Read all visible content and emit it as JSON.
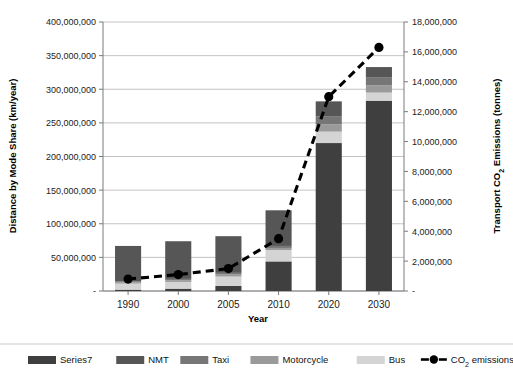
{
  "chart_data": {
    "type": "bar",
    "title": "",
    "subtitle": "",
    "xlabel": "Year",
    "ylabel": "Distance by Mode Share (km/year)",
    "y2label": "Transport CO2 Emissions (tonnes)",
    "y2label_rich": {
      "pre": "Transport CO",
      "sub": "2",
      "post": " Emissions (tonnes)"
    },
    "categories": [
      "1990",
      "2000",
      "2005",
      "2010",
      "2020",
      "2030"
    ],
    "ylim": [
      0,
      400000000
    ],
    "y2lim": [
      0,
      18000000
    ],
    "ytick_labels": [
      "-",
      "50,000,000",
      "100,000,000",
      "150,000,000",
      "200,000,000",
      "250,000,000",
      "300,000,000",
      "350,000,000",
      "400,000,000"
    ],
    "ytick_values": [
      0,
      50000000,
      100000000,
      150000000,
      200000000,
      250000000,
      300000000,
      350000000,
      400000000
    ],
    "y2tick_labels": [
      "-",
      "2,000,000",
      "4,000,000",
      "6,000,000",
      "8,000,000",
      "10,000,000",
      "12,000,000",
      "14,000,000",
      "16,000,000",
      "18,000,000"
    ],
    "y2tick_values": [
      0,
      2000000,
      4000000,
      6000000,
      8000000,
      10000000,
      12000000,
      14000000,
      16000000,
      18000000
    ],
    "grid": true,
    "legend_position": "bottom",
    "stacked": true,
    "series": [
      {
        "name": "Series7",
        "color": "#3f3f3f",
        "values": [
          2000000,
          3500000,
          7500000,
          44000000,
          220000000,
          283000000
        ]
      },
      {
        "name": "Bus",
        "color": "#d4d4d4",
        "values": [
          9000000,
          10000000,
          14000000,
          17000000,
          17000000,
          12000000
        ]
      },
      {
        "name": "Motorcycle",
        "color": "#9a9a9a",
        "values": [
          2000000,
          2500000,
          3000000,
          3000000,
          11000000,
          11000000
        ]
      },
      {
        "name": "Taxi",
        "color": "#767676",
        "values": [
          1500000,
          2000000,
          2500000,
          3000000,
          12000000,
          12000000
        ]
      },
      {
        "name": "NMT",
        "color": "#565656",
        "values": [
          52500000,
          56000000,
          54500000,
          53000000,
          22000000,
          15000000
        ]
      }
    ],
    "co2": {
      "name": "CO2 emissions",
      "name_rich": {
        "pre": "CO",
        "sub": "2",
        "post": " emissions"
      },
      "color": "#000000",
      "values": [
        800000,
        1100000,
        1500000,
        3500000,
        13000000,
        16300000
      ]
    },
    "legend_entries": [
      {
        "label": "Series7",
        "color": "#3f3f3f",
        "kind": "swatch"
      },
      {
        "label": "NMT",
        "color": "#565656",
        "kind": "swatch"
      },
      {
        "label": "Taxi",
        "color": "#767676",
        "kind": "swatch"
      },
      {
        "label": "Motorcycle",
        "color": "#9a9a9a",
        "kind": "swatch"
      },
      {
        "label": "Bus",
        "color": "#d4d4d4",
        "kind": "swatch"
      },
      {
        "label": "CO2 emissions",
        "color": "#000000",
        "kind": "line-marker"
      }
    ]
  }
}
